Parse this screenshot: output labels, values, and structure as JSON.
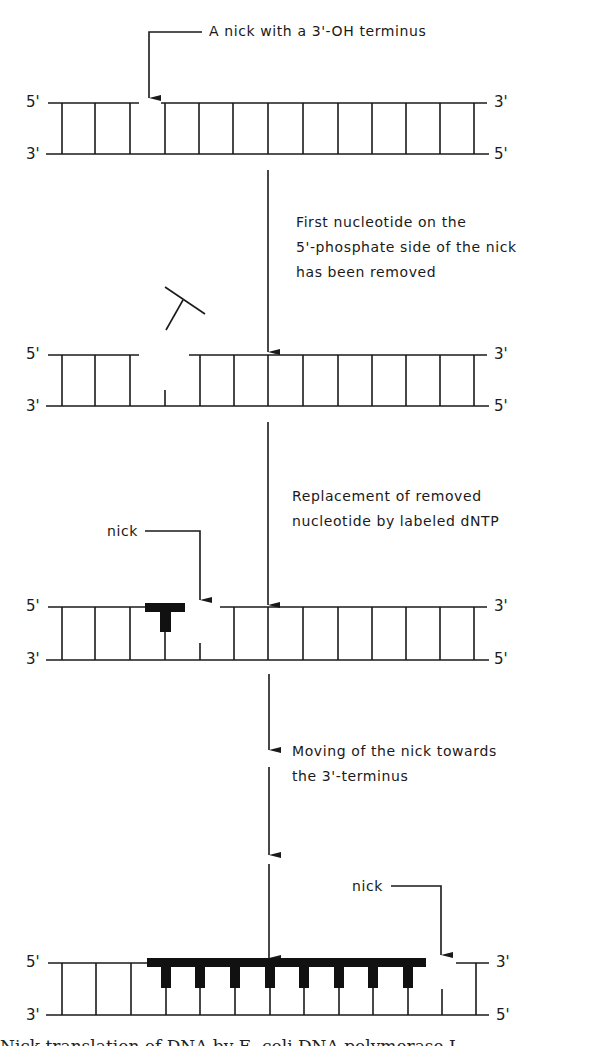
{
  "figure": {
    "colors": {
      "ink": "#1a1a1a",
      "background": "#ffffff"
    },
    "stages": [
      {
        "id": "stage1",
        "callout": "A nick with a 3'-OH terminus",
        "end_labels": {
          "top_left": "5'",
          "top_right": "3'",
          "bottom_left": "3'",
          "bottom_right": "5'"
        }
      },
      {
        "id": "stage2",
        "step_label": "First nucleotide on the\n5'-phosphate side of the nick\nhas been removed",
        "end_labels": {
          "top_left": "5'",
          "top_right": "3'",
          "bottom_left": "3'",
          "bottom_right": "5'"
        },
        "free_nucleotide": "removed nucleotide"
      },
      {
        "id": "stage3",
        "step_label": "Replacement of removed\nnucleotide by labeled dNTP",
        "nick_label": "nick",
        "end_labels": {
          "top_left": "5'",
          "top_right": "3'",
          "bottom_left": "3'",
          "bottom_right": "5'"
        }
      },
      {
        "id": "stage4",
        "step_label": "Moving of the nick towards\nthe 3'-terminus",
        "nick_label": "nick",
        "end_labels": {
          "top_left": "5'",
          "top_right": "3'",
          "bottom_left": "3'",
          "bottom_right": "5'"
        }
      }
    ],
    "caption_clipped": "Nick translation of DNA by E. coli DNA polymerase I"
  }
}
